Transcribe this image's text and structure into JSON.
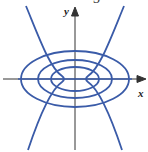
{
  "figure": {
    "panel_label": "3",
    "x_axis_label": "x",
    "y_axis_label": "y",
    "curve_color": "#3a5ba8",
    "axis_color": "#333333",
    "curves": {
      "ellipses": 3,
      "hyperbola_branches": 2
    }
  }
}
